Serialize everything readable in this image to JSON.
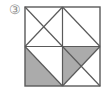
{
  "figure": {
    "label": "③",
    "label_name": "circled-number-three",
    "caption": "",
    "colors": {
      "shade": "#ababab",
      "background": "#ffffff",
      "stroke": "#5a5a5a",
      "label": "#8a8a8a"
    }
  },
  "diagram": {
    "type": "square-dissection",
    "title": "",
    "square": {
      "x": 25,
      "y": 7,
      "width": 75,
      "height": 79
    },
    "grid": {
      "rows": 2,
      "cols": 2,
      "midlines": [
        "vertical-center",
        "horizontal-center"
      ]
    },
    "quadrants": [
      {
        "name": "top-left",
        "diagonals": [
          "main",
          "anti"
        ],
        "shaded_triangles": []
      },
      {
        "name": "top-right",
        "diagonals": [
          "anti"
        ],
        "shaded_triangles": []
      },
      {
        "name": "bottom-left",
        "diagonals": [
          "main"
        ],
        "shaded_triangles": [
          "lower-left"
        ]
      },
      {
        "name": "bottom-right",
        "diagonals": [
          "main",
          "anti"
        ],
        "shaded_triangles": [
          "top",
          "left"
        ]
      }
    ],
    "shaded_count": 3,
    "shaded_color": "#ababab"
  }
}
